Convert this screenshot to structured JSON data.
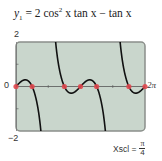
{
  "chart_data": {
    "type": "line",
    "function": "2*cos(x)^2*tan(x) - tan(x)",
    "xlim": [
      0,
      6.283185307
    ],
    "ylim": [
      -2,
      2
    ],
    "xlabel": "",
    "ylabel": "",
    "x_tick_labels": {
      "left": "0",
      "right": "2π"
    },
    "y_tick_labels": {
      "top": "2",
      "bottom": "−2"
    },
    "xscl": "π/4",
    "grid": false,
    "zeros_marked": [
      0,
      0.785398,
      2.356194,
      3.141593,
      3.926991,
      5.497787,
      6.283185
    ],
    "zeros_labels": [
      "0",
      "π/4",
      "3π/4",
      "π",
      "5π/4",
      "7π/4",
      "2π"
    ],
    "colors": {
      "screen": "#c9d6cc",
      "curve": "#111111",
      "points": "#e0484f",
      "frame": "#8a8f8a"
    }
  },
  "title": {
    "lhs": "y",
    "sub": "1",
    "rhs_a": " = 2 cos",
    "sup": "2",
    "rhs_b": " x tan x − tan x"
  },
  "axis_labels": {
    "ymax": "2",
    "ymin": "−2",
    "xmin": "0",
    "xmax": "2π"
  },
  "xscl": {
    "label": "Xscl =",
    "num": "π",
    "den": "4"
  }
}
